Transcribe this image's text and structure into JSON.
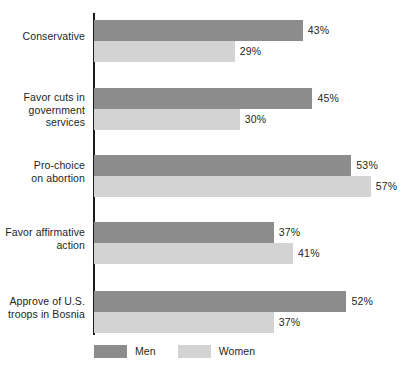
{
  "chart_data": {
    "type": "bar",
    "orientation": "horizontal",
    "title": "",
    "subtitle": "",
    "xlabel": "",
    "ylabel": "",
    "grid": false,
    "xlim": [
      0,
      60
    ],
    "legend_position": "bottom-left",
    "categories": [
      "Conservative",
      "Favor cuts in\ngovernment\nservices",
      "Pro-choice\non abortion",
      "Favor affirmative\naction",
      "Approve of U.S.\ntroops in Bosnia"
    ],
    "series": [
      {
        "name": "Men",
        "color": "#8c8c8c",
        "values": [
          43,
          45,
          53,
          37,
          52
        ],
        "value_labels": [
          "43%",
          "45%",
          "53%",
          "37%",
          "52%"
        ]
      },
      {
        "name": "Women",
        "color": "#d3d3d3",
        "values": [
          29,
          30,
          57,
          41,
          37
        ],
        "value_labels": [
          "29%",
          "30%",
          "57%",
          "41%",
          "37%"
        ]
      }
    ]
  },
  "legend": {
    "items": [
      {
        "label": "Men",
        "color": "#8c8c8c",
        "swatch": "men-swatch"
      },
      {
        "label": "Women",
        "color": "#d3d3d3",
        "swatch": "women-swatch"
      }
    ]
  },
  "axis": {
    "line_color": "#1c1a1b"
  },
  "groups": [
    {
      "label": "Conservative",
      "men_value": 43,
      "men_label": "43%",
      "women_value": 29,
      "women_label": "29%"
    },
    {
      "label": "Favor cuts in\ngovernment\nservices",
      "men_value": 45,
      "men_label": "45%",
      "women_value": 30,
      "women_label": "30%"
    },
    {
      "label": "Pro-choice\non abortion",
      "men_value": 53,
      "men_label": "53%",
      "women_value": 57,
      "women_label": "57%"
    },
    {
      "label": "Favor affirmative\naction",
      "men_value": 37,
      "men_label": "37%",
      "women_value": 41,
      "women_label": "41%"
    },
    {
      "label": "Approve of U.S.\ntroops in Bosnia",
      "men_value": 52,
      "men_label": "52%",
      "women_value": 37,
      "women_label": "37%"
    }
  ]
}
